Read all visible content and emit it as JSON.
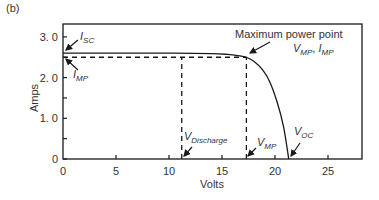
{
  "panel_label": "(b)",
  "chart_data": {
    "type": "line",
    "title": "",
    "xlabel": "Volts",
    "ylabel": "Amps",
    "xlim": [
      0,
      28
    ],
    "ylim": [
      0,
      3.0
    ],
    "x_ticks": [
      0,
      5,
      10,
      15,
      20,
      25
    ],
    "x_tick_labels": [
      "0",
      "5",
      "10",
      "15",
      "20",
      "25"
    ],
    "y_ticks": [
      0,
      0.5,
      1.0,
      1.5,
      2.0,
      2.5,
      3.0
    ],
    "y_tick_labels": [
      "0",
      "",
      "1. 0",
      "",
      "2. 0",
      "",
      "3. 0"
    ],
    "grid": false,
    "legend": null,
    "series": [
      {
        "name": "I-V curve",
        "style": "solid",
        "x": [
          0,
          5,
          10,
          14,
          15.5,
          16.5,
          17.3,
          18.0,
          18.8,
          19.5,
          20.2,
          20.8,
          21.3
        ],
        "y": [
          2.6,
          2.6,
          2.6,
          2.59,
          2.57,
          2.54,
          2.5,
          2.4,
          2.2,
          1.9,
          1.4,
          0.8,
          0
        ]
      }
    ],
    "reference_lines": [
      {
        "name": "Imp horizontal",
        "style": "dashed",
        "x": [
          0,
          17.3
        ],
        "y": [
          2.5,
          2.5
        ]
      },
      {
        "name": "Vdischarge vertical",
        "style": "dashed",
        "x": [
          11.2,
          11.2
        ],
        "y": [
          0,
          2.5
        ]
      },
      {
        "name": "Vmp vertical",
        "style": "dashed",
        "x": [
          17.3,
          17.3
        ],
        "y": [
          0,
          2.5
        ]
      }
    ],
    "key_points": {
      "Isc": 2.6,
      "Imp": 2.5,
      "Vmp": 17.3,
      "Vdischarge": 11.2,
      "Voc": 21.3
    },
    "annotations": [
      {
        "text": "I",
        "subscript": "SC",
        "points_to": [
          0,
          2.6
        ]
      },
      {
        "text": "I",
        "subscript": "MP",
        "points_to": [
          0,
          2.5
        ]
      },
      {
        "text": "Maximum power point",
        "points_to": [
          17.3,
          2.5
        ]
      },
      {
        "text": "V",
        "subscript": "MP",
        "text2": "I",
        "subscript2": "MP",
        "separator": ", "
      },
      {
        "text": "V",
        "subscript": "Discharge",
        "points_to": [
          11.2,
          0
        ]
      },
      {
        "text": "V",
        "subscript": "MP",
        "points_to": [
          17.3,
          0
        ]
      },
      {
        "text": "V",
        "subscript": "OC",
        "points_to": [
          21.3,
          0
        ]
      }
    ]
  },
  "labels": {
    "isc_main": "I",
    "isc_sub": "SC",
    "imp_main": "I",
    "imp_sub": "MP",
    "mpp_title": "Maximum power point",
    "mpp_v_main": "V",
    "mpp_v_sub": "MP",
    "mpp_sep": ", ",
    "mpp_i_main": "I",
    "mpp_i_sub": "MP",
    "vdis_main": "V",
    "vdis_sub": "Discharge",
    "vmp_main": "V",
    "vmp_sub": "MP",
    "voc_main": "V",
    "voc_sub": "OC"
  },
  "colors": {
    "line": "#1a1a1a",
    "text": "#333333",
    "background": "#ffffff"
  }
}
